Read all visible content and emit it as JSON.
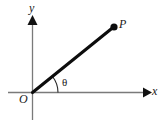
{
  "figure": {
    "type": "diagram",
    "background_color": "#ffffff",
    "axis_color": "#7a7a7a",
    "ray_color": "#0d0d0d",
    "arrow_color": "#111111",
    "labels": {
      "x_axis": "x",
      "y_axis": "y",
      "origin": "O",
      "point": "P",
      "angle": "θ"
    },
    "icons": {
      "x_axis_arrow": "arrow-right-icon",
      "y_axis_arrow": "arrow-up-icon",
      "point_marker": "filled-dot-icon",
      "angle_marker": "arc-icon"
    },
    "geometry": {
      "origin": [
        32,
        92
      ],
      "point_P": [
        114,
        27
      ],
      "x_axis_from": [
        8,
        92
      ],
      "x_axis_to": [
        150,
        92
      ],
      "y_axis_from": [
        32,
        120
      ],
      "y_axis_to": [
        32,
        16
      ],
      "angle_arc_radius": 33,
      "angle_degrees": 38
    }
  }
}
